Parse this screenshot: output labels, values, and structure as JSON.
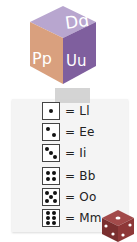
{
  "cube": {
    "top_label": "Dd",
    "left_label": "Pp",
    "right_label": "Uu",
    "colors": {
      "top": "#b8a6cf",
      "left": "#e0a786",
      "right": "#8a6aa8",
      "text": "#ffffff"
    }
  },
  "legend": {
    "rows": [
      {
        "pips": 1,
        "text": "= Ll"
      },
      {
        "pips": 2,
        "text": "= Ee"
      },
      {
        "pips": 3,
        "text": "= Ii"
      },
      {
        "pips": 4,
        "text": "= Bb"
      },
      {
        "pips": 5,
        "text": "= Oo"
      },
      {
        "pips": 6,
        "text": "= Mm"
      }
    ]
  },
  "decor": {
    "die_color": "#8a3a3a"
  }
}
